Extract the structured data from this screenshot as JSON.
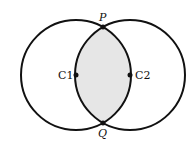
{
  "diagram": {
    "circles": [
      {
        "name": "C1",
        "cx": 76,
        "cy": 75,
        "r": 55
      },
      {
        "name": "C2",
        "cx": 130,
        "cy": 75,
        "r": 55
      }
    ],
    "points": {
      "P": {
        "label": "P",
        "x": 103,
        "y": 27
      },
      "Q": {
        "label": "Q",
        "x": 103,
        "y": 123
      },
      "C1": {
        "label": "C1",
        "x": 76,
        "y": 75
      },
      "C2": {
        "label": "C2",
        "x": 130,
        "y": 75
      }
    },
    "colors": {
      "stroke": "#111111",
      "fill_intersection": "#e6e6e6"
    }
  }
}
